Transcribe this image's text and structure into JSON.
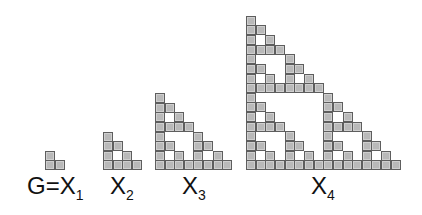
{
  "figure": {
    "cell_color": "#b9b9b9",
    "cell_border_color": "#5e5e5e",
    "stages": [
      {
        "label_main": "G=X",
        "label_sub": "1",
        "rows": 2,
        "x": 45,
        "bottom": 170,
        "cell": 9.6,
        "label_x": 27
      },
      {
        "label_main": "X",
        "label_sub": "2",
        "rows": 4,
        "x": 103,
        "bottom": 170,
        "cell": 9.6,
        "label_x": 110
      },
      {
        "label_main": "X",
        "label_sub": "3",
        "rows": 8,
        "x": 155,
        "bottom": 170,
        "cell": 9.6,
        "label_x": 182
      },
      {
        "label_main": "X",
        "label_sub": "4",
        "rows": 16,
        "x": 246,
        "bottom": 170,
        "cell": 9.65,
        "label_x": 311
      }
    ]
  }
}
